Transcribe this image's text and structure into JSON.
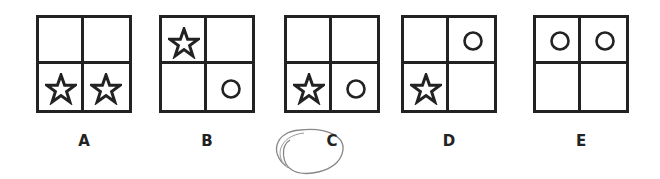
{
  "options": [
    {
      "label": "A",
      "cells": [
        "",
        "",
        "star",
        "star"
      ]
    },
    {
      "label": "B",
      "cells": [
        "star",
        "",
        "",
        "circle"
      ]
    },
    {
      "label": "C",
      "cells": [
        "",
        "",
        "star",
        "circle"
      ],
      "selected": true
    },
    {
      "label": "D",
      "cells": [
        "",
        "circle",
        "star",
        ""
      ]
    },
    {
      "label": "E",
      "cells": [
        "circle",
        "circle",
        "",
        ""
      ]
    }
  ],
  "colors": {
    "stroke": "#222222",
    "handwritten_circle": "#888888"
  }
}
